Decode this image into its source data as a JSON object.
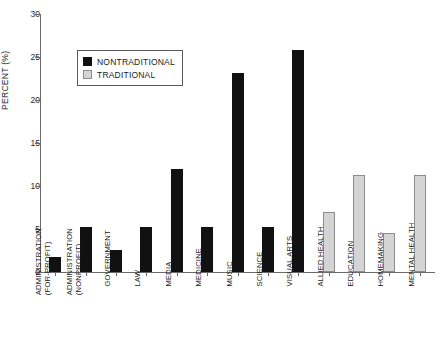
{
  "chart_data": {
    "type": "bar",
    "title": "",
    "xlabel": "",
    "ylabel": "PERCENT (%)",
    "ylim": [
      0,
      30
    ],
    "yticks": [
      0,
      5,
      10,
      15,
      20,
      25,
      30
    ],
    "grid": false,
    "legend_position": "upper-left-inside",
    "categories": [
      "ADMINISTRATION (FOR-PROFIT)",
      "ADMINISTRATION (NONPROFIT)",
      "GOVERNMENT",
      "LAW",
      "MEDIA",
      "MEDICINE",
      "MUSIC",
      "SCIENCE",
      "VISUAL ARTS",
      "ALLIED HEALTH",
      "EDUCATION",
      "HOMEMAKING",
      "MENTAL HEALTH"
    ],
    "category_lines": [
      [
        "ADMINISTRATION",
        "(FOR-PROFIT)"
      ],
      [
        "ADMINISTRATION",
        "(NONPROFIT)"
      ],
      [
        "GOVERNMENT",
        ""
      ],
      [
        "LAW",
        ""
      ],
      [
        "MEDIA",
        ""
      ],
      [
        "MEDICINE",
        ""
      ],
      [
        "MUSIC",
        ""
      ],
      [
        "SCIENCE",
        ""
      ],
      [
        "VISUAL ARTS",
        ""
      ],
      [
        "ALLIED HEALTH",
        ""
      ],
      [
        "EDUCATION",
        ""
      ],
      [
        "HOMEMAKING",
        ""
      ],
      [
        "MENTAL HEALTH",
        ""
      ]
    ],
    "series": [
      {
        "name": "NONTRADITIONAL",
        "color": "#111111",
        "values": [
          1.8,
          5.2,
          2.6,
          5.2,
          12.0,
          5.2,
          23.1,
          5.2,
          25.8,
          null,
          null,
          null,
          null
        ]
      },
      {
        "name": "TRADITIONAL",
        "color": "#d4d4d4",
        "values": [
          null,
          null,
          null,
          null,
          null,
          null,
          null,
          null,
          null,
          7.0,
          11.3,
          4.5,
          11.3
        ]
      }
    ],
    "bar_values": [
      1.8,
      5.2,
      2.6,
      5.2,
      12.0,
      5.2,
      23.1,
      5.2,
      25.8,
      7.0,
      11.3,
      4.5,
      11.3
    ],
    "bar_groups": [
      "NONTRADITIONAL",
      "NONTRADITIONAL",
      "NONTRADITIONAL",
      "NONTRADITIONAL",
      "NONTRADITIONAL",
      "NONTRADITIONAL",
      "NONTRADITIONAL",
      "NONTRADITIONAL",
      "NONTRADITIONAL",
      "TRADITIONAL",
      "TRADITIONAL",
      "TRADITIONAL",
      "TRADITIONAL"
    ]
  },
  "legend": {
    "entries": [
      {
        "label": "NONTRADITIONAL",
        "color": "#111111",
        "key": "nontraditional"
      },
      {
        "label": "TRADITIONAL",
        "color": "#d4d4d4",
        "key": "traditional"
      }
    ]
  },
  "axes": {
    "y_title": "PERCENT (%)",
    "y_tick_labels": [
      "0",
      "5",
      "10",
      "15",
      "20",
      "25",
      "30"
    ]
  }
}
